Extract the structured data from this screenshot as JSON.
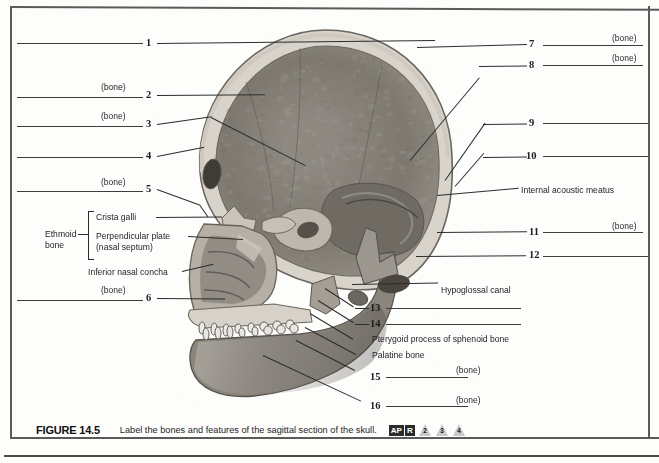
{
  "figure": {
    "number": "FIGURE 14.5",
    "caption": "Label the bones and features of the sagittal section of the skull.",
    "apr_badge_1": "AP",
    "apr_badge_2": "R",
    "triangle_badges": [
      "2",
      "3",
      "4"
    ]
  },
  "bone_tag": "(bone)",
  "left_labels": [
    {
      "num": "1",
      "has_bone_tag": false
    },
    {
      "num": "2",
      "has_bone_tag": true
    },
    {
      "num": "3",
      "has_bone_tag": true
    },
    {
      "num": "4",
      "has_bone_tag": false
    },
    {
      "num": "5",
      "has_bone_tag": true
    },
    {
      "num": "6",
      "has_bone_tag": true
    }
  ],
  "right_labels": [
    {
      "num": "7",
      "has_bone_tag": true
    },
    {
      "num": "8",
      "has_bone_tag": true
    },
    {
      "num": "9",
      "has_bone_tag": false
    },
    {
      "num": "10",
      "has_bone_tag": false
    },
    {
      "num": "11",
      "has_bone_tag": true
    },
    {
      "num": "12",
      "has_bone_tag": false
    },
    {
      "num": "13",
      "has_bone_tag": false
    },
    {
      "num": "14",
      "has_bone_tag": false
    },
    {
      "num": "15",
      "has_bone_tag": true
    },
    {
      "num": "16",
      "has_bone_tag": true
    }
  ],
  "named_annotations": {
    "ethmoid_bone_line1": "Ethmoid",
    "ethmoid_bone_line2": "bone",
    "crista_galli": "Crista galli",
    "perpendicular_plate_line1": "Perpendicular plate",
    "perpendicular_plate_line2": "(nasal septum)",
    "inferior_nasal_concha": "Inferior nasal concha",
    "internal_acoustic_meatus": "Internal acoustic meatus",
    "hypoglossal_canal": "Hypoglossal canal",
    "pterygoid_process": "Pterygoid process of sphenoid bone",
    "palatine_bone": "Palatine bone"
  },
  "colors": {
    "page_background": "#fdfdfc",
    "ink": "#1c1c1c",
    "frame": "#5a5a58",
    "bone_light": "#d9d4cb",
    "bone_mid": "#a9a399",
    "bone_dark": "#6e6a62",
    "cavity_shadow": "#8d8880"
  }
}
